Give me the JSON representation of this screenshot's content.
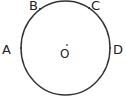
{
  "diagram": {
    "type": "geometry-circle",
    "stroke_color": "#333333",
    "circle": {
      "cx": 65.5,
      "cy": 48,
      "rx": 44.5,
      "ry": 47
    },
    "center": {
      "label": "O",
      "x": 60,
      "y": 58,
      "dot": {
        "x": 67,
        "y": 45
      }
    },
    "points": [
      {
        "label": "A",
        "x": 21,
        "y": 48,
        "label_x": 2,
        "label_y": 54
      },
      {
        "label": "B",
        "x": 40,
        "y": 9,
        "label_x": 29,
        "label_y": 10
      },
      {
        "label": "C",
        "x": 89,
        "y": 8,
        "label_x": 91,
        "label_y": 10
      },
      {
        "label": "D",
        "x": 110,
        "y": 48,
        "label_x": 113,
        "label_y": 54
      }
    ]
  }
}
